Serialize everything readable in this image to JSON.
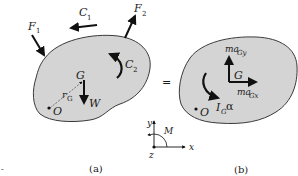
{
  "colors": {
    "body_fill": "#d4d4d4",
    "outline": "#3a3a3a",
    "ink": "#111111",
    "background": "#ffffff"
  },
  "figure_a": {
    "caption": "(a)",
    "labels": {
      "F1_main": "F",
      "F1_sub": "1",
      "F2_main": "F",
      "F2_sub": "2",
      "C1_main": "C",
      "C1_sub": "1",
      "C2_main": "C",
      "C2_sub": "2",
      "G": "G",
      "rG_main": "r",
      "rG_sub": "G",
      "W": "W",
      "O": "O"
    }
  },
  "equals_sign": "=",
  "figure_b": {
    "caption": "(b)",
    "labels": {
      "maGy_main": "ma",
      "maGy_sub": "Gy",
      "maGx_main": "ma",
      "maGx_sub": "Gx",
      "G": "G",
      "IGa_main": "I",
      "IGa_sub": "G",
      "IGa_alpha": "α",
      "O": "O"
    }
  },
  "axes": {
    "x": "x",
    "y": "y",
    "z": "z",
    "M": "M"
  },
  "stray_mark": "-"
}
